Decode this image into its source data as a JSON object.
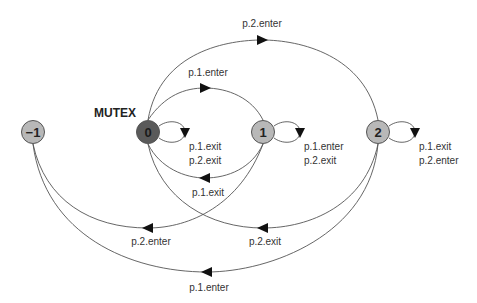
{
  "diagram": {
    "title": "MUTEX",
    "nodes": [
      {
        "id": "-1",
        "label": "−1",
        "fill": "#b8b8b8",
        "text": "#222222",
        "x": 33,
        "y": 132
      },
      {
        "id": "0",
        "label": "0",
        "fill": "#5a5a5a",
        "text": "#1a1a1a",
        "x": 148,
        "y": 132
      },
      {
        "id": "1",
        "label": "1",
        "fill": "#b8b8b8",
        "text": "#222222",
        "x": 263,
        "y": 132
      },
      {
        "id": "2",
        "label": "2",
        "fill": "#b8b8b8",
        "text": "#222222",
        "x": 378,
        "y": 132
      }
    ],
    "edges": [
      {
        "from": "0",
        "to": "2",
        "label": "p.2.enter"
      },
      {
        "from": "0",
        "to": "1",
        "label": "p.1.enter"
      },
      {
        "from": "1",
        "to": "0",
        "label": "p.1.exit"
      },
      {
        "from": "1",
        "to": "-1",
        "label": "p.2.enter"
      },
      {
        "from": "2",
        "to": "0",
        "label": "p.2.exit"
      },
      {
        "from": "2",
        "to": "-1",
        "label": "p.1.enter"
      }
    ],
    "self_loops": [
      {
        "node": "0",
        "labels": [
          "p.1.exit",
          "p.2.exit"
        ]
      },
      {
        "node": "1",
        "labels": [
          "p.1.enter",
          "p.2.exit"
        ]
      },
      {
        "node": "2",
        "labels": [
          "p.1.exit",
          "p.2.enter"
        ]
      }
    ]
  }
}
